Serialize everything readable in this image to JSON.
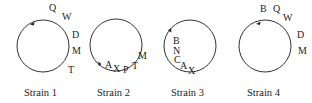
{
  "strains": [
    {
      "label": "Strain 1",
      "genes": [
        {
          "text": "Q",
          "x": 49,
          "y": 11
        },
        {
          "text": "W",
          "x": 62,
          "y": 20
        },
        {
          "text": "D",
          "x": 72,
          "y": 38
        },
        {
          "text": "M",
          "x": 72,
          "y": 54
        },
        {
          "text": "T",
          "x": 68,
          "y": 73
        }
      ],
      "arrow_direction": "counterclockwise-at-top"
    },
    {
      "label": "Strain 2",
      "genes": [
        {
          "text": "A",
          "x": 105,
          "y": 68
        },
        {
          "text": "X",
          "x": 113,
          "y": 72
        },
        {
          "text": "P",
          "x": 123,
          "y": 73
        },
        {
          "text": "T",
          "x": 132,
          "y": 69
        },
        {
          "text": "M",
          "x": 138,
          "y": 59
        }
      ],
      "arrow_direction": "bottom-left"
    },
    {
      "label": "Strain 3",
      "genes": [
        {
          "text": "B",
          "x": 173,
          "y": 44
        },
        {
          "text": "N",
          "x": 173,
          "y": 54
        },
        {
          "text": "C",
          "x": 174,
          "y": 63
        },
        {
          "text": "A",
          "x": 180,
          "y": 69
        },
        {
          "text": "X",
          "x": 188,
          "y": 74
        }
      ],
      "arrow_direction": "top-left"
    },
    {
      "label": "Strain 4",
      "genes": [
        {
          "text": "B",
          "x": 260,
          "y": 12
        },
        {
          "text": "Q",
          "x": 273,
          "y": 12
        },
        {
          "text": "W",
          "x": 283,
          "y": 21
        },
        {
          "text": "D",
          "x": 297,
          "y": 38
        },
        {
          "text": "M",
          "x": 298,
          "y": 54
        }
      ],
      "arrow_direction": "counterclockwise-at-top"
    }
  ]
}
